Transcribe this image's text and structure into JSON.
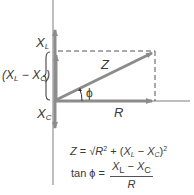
{
  "diagram": {
    "colors": {
      "axis": "#9a9a9a",
      "vector": "#8c8c8c",
      "dashed": "#555555",
      "text": "#3a3a3a",
      "background": "#ffffff"
    },
    "labels": {
      "xl": "X",
      "xl_sub": "L",
      "diff_open": "(X",
      "diff_sub1": "L",
      "diff_mid": " − X",
      "diff_sub2": "C",
      "diff_close": ")",
      "xc": "X",
      "xc_sub": "C",
      "z": "Z",
      "r": "R",
      "phi": "ϕ"
    },
    "equations": {
      "z_eq": {
        "lhs": "Z",
        "eq": " = ",
        "sqrt": "√",
        "r": "R",
        "r_exp": "2",
        "plus": " + (",
        "xl": "X",
        "xl_sub": "L",
        "minus": " − ",
        "xc": "X",
        "xc_sub": "C",
        "close": ")",
        "exp": "2"
      },
      "tan_eq": {
        "lhs": "tan ϕ = ",
        "num_xl": "X",
        "num_xl_sub": "L",
        "num_minus": " − ",
        "num_xc": "X",
        "num_xc_sub": "C",
        "den": "R"
      }
    }
  }
}
